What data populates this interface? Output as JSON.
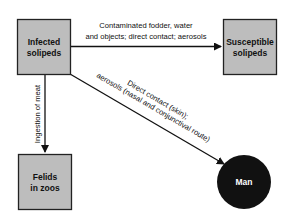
{
  "diagram": {
    "nodes": [
      {
        "id": "infected",
        "shape": "box",
        "lines": [
          "Infected",
          "solipeds"
        ],
        "fill": "#bdbdbd"
      },
      {
        "id": "susceptible",
        "shape": "box",
        "lines": [
          "Susceptible",
          "solipeds"
        ],
        "fill": "#bdbdbd"
      },
      {
        "id": "felids",
        "shape": "box",
        "lines": [
          "Felids",
          "in zoos"
        ],
        "fill": "#bdbdbd"
      },
      {
        "id": "man",
        "shape": "circle",
        "lines": [
          "Man"
        ],
        "fill": "#111111"
      }
    ],
    "edges": [
      {
        "from": "infected",
        "to": "susceptible",
        "lines": [
          "Contaminated fodder, water",
          "and objects; direct contact; aerosols"
        ]
      },
      {
        "from": "infected",
        "to": "felids",
        "lines": [
          "Ingestion of meat"
        ]
      },
      {
        "from": "infected",
        "to": "man",
        "lines": [
          "Direct contact (skin);",
          "aerosols (nasal and conjunctival route)"
        ]
      }
    ]
  }
}
